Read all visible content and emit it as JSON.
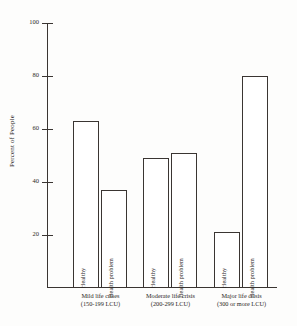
{
  "chart_data": {
    "type": "bar",
    "title": "",
    "xlabel": "",
    "ylabel": "Percent of People",
    "ylim": [
      0,
      100
    ],
    "grid": false,
    "legend": "none",
    "categories": [
      "Mild life crises (150-199 LCU)",
      "Moderate life crisis (200-299 LCU)",
      "Major life crisis (300 or more LCU)"
    ],
    "series": [
      {
        "name": "Healthy",
        "values": [
          63,
          49,
          21
        ]
      },
      {
        "name": "Health problem",
        "values": [
          37,
          51,
          80
        ]
      }
    ],
    "ytick_labels": [
      "100",
      "80",
      "60",
      "40",
      "20"
    ],
    "ytick_values": [
      100,
      80,
      60,
      40,
      20
    ]
  },
  "axis": {
    "ylabel": "Percent of People",
    "ticks": [
      {
        "label": "100",
        "value": 100
      },
      {
        "label": "80",
        "value": 80
      },
      {
        "label": "60",
        "value": 60
      },
      {
        "label": "40",
        "value": 40
      },
      {
        "label": "20",
        "value": 20
      }
    ]
  },
  "groups": [
    {
      "caption_line1": "Mild life crises",
      "caption_line2": "(150-199 LCU)",
      "bars": [
        {
          "label": "Healthy",
          "value": 63
        },
        {
          "label": "Health problem",
          "value": 37
        }
      ]
    },
    {
      "caption_line1": "Moderate life crisis",
      "caption_line2": "(200-299 LCU)",
      "bars": [
        {
          "label": "Healthy",
          "value": 49
        },
        {
          "label": "Health problem",
          "value": 51
        }
      ]
    },
    {
      "caption_line1": "Major life crisis",
      "caption_line2": "(300 or more LCU)",
      "bars": [
        {
          "label": "Healthy",
          "value": 21
        },
        {
          "label": "Health problem",
          "value": 80
        }
      ]
    }
  ]
}
